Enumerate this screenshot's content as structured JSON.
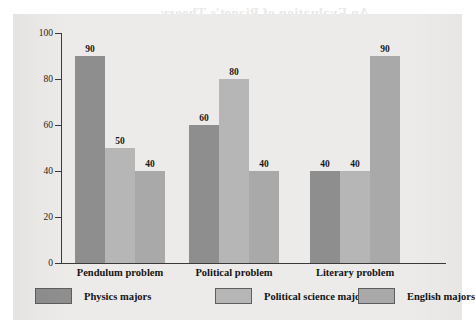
{
  "page": {
    "bleed_through_text": "An Evaluation of Piaget's Theory"
  },
  "chart_data": {
    "type": "bar",
    "title": "",
    "xlabel": "",
    "ylabel": "Percentage displaying formal thought",
    "ylim": [
      0,
      100
    ],
    "ytick_labels": [
      "0",
      "20",
      "40",
      "60",
      "80",
      "100"
    ],
    "ytick_values": [
      0,
      20,
      40,
      60,
      80,
      100
    ],
    "grid": false,
    "legend_position": "bottom",
    "categories": [
      "Pendulum problem",
      "Political problem",
      "Literary problem"
    ],
    "series": [
      {
        "name": "Physics majors",
        "color": "#8e8e8e",
        "values": [
          90,
          60,
          40
        ]
      },
      {
        "name": "Political science majors",
        "color": "#b6b6b6",
        "values": [
          50,
          80,
          40
        ]
      },
      {
        "name": "English majors",
        "color": "#a9a9a9",
        "values": [
          40,
          40,
          90
        ]
      }
    ],
    "bar_labels": [
      [
        "90",
        "50",
        "40"
      ],
      [
        "60",
        "80",
        "40"
      ],
      [
        "40",
        "40",
        "90"
      ]
    ]
  }
}
